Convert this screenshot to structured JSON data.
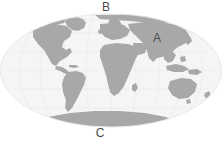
{
  "figure": {
    "type": "world-map-mollweide",
    "background_color": "#ffffff",
    "ocean_color": "#f5f5f5",
    "land_color": "#a8a8a8",
    "graticule_color": "#e2e2e2",
    "label_color": "#4a4a4a",
    "width": 222,
    "height": 142
  },
  "labels": {
    "a": "A",
    "b": "B",
    "c": "C"
  },
  "annotations": [
    {
      "id": "a",
      "text": "A",
      "x": 157,
      "y": 39,
      "points_to": "asia-india-himalaya-region"
    },
    {
      "id": "b",
      "text": "B",
      "x": 106,
      "y": 8,
      "points_to": "north-polar-arctic-region"
    },
    {
      "id": "c",
      "text": "C",
      "x": 100,
      "y": 134,
      "points_to": "south-polar-antarctica-region"
    }
  ],
  "landmasses": [
    "north-america",
    "south-america",
    "greenland",
    "europe",
    "africa",
    "asia",
    "australia",
    "antarctica"
  ]
}
